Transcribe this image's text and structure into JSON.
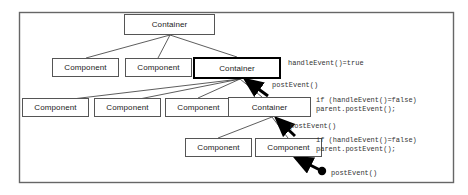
{
  "diagram": {
    "frame": {
      "border_color": "#666666"
    },
    "nodes": [
      {
        "id": "root",
        "label": "Container",
        "x": 124,
        "y": 14,
        "w": 91,
        "h": 21,
        "bold": false
      },
      {
        "id": "r2c1",
        "label": "Component",
        "x": 52,
        "y": 58,
        "w": 67,
        "h": 19,
        "bold": false
      },
      {
        "id": "r2c2",
        "label": "Component",
        "x": 125,
        "y": 58,
        "w": 67,
        "h": 19,
        "bold": false
      },
      {
        "id": "r2cont",
        "label": "Container",
        "x": 193,
        "y": 57,
        "w": 88,
        "h": 22,
        "bold": true
      },
      {
        "id": "r3c1",
        "label": "Component",
        "x": 22,
        "y": 98,
        "w": 67,
        "h": 19,
        "bold": false
      },
      {
        "id": "r3c2",
        "label": "Component",
        "x": 94,
        "y": 98,
        "w": 67,
        "h": 19,
        "bold": false
      },
      {
        "id": "r3c3",
        "label": "Component",
        "x": 165,
        "y": 98,
        "w": 67,
        "h": 19,
        "bold": false
      },
      {
        "id": "r3cont",
        "label": "Container",
        "x": 228,
        "y": 97,
        "w": 83,
        "h": 20,
        "bold": false
      },
      {
        "id": "r4c1",
        "label": "Component",
        "x": 185,
        "y": 138,
        "w": 67,
        "h": 19,
        "bold": false
      },
      {
        "id": "r4c2",
        "label": "Component",
        "x": 255,
        "y": 138,
        "w": 67,
        "h": 19,
        "bold": false
      }
    ],
    "annotations": [
      {
        "id": "handle-true",
        "text": "handleEvent()=true",
        "x": 288,
        "y": 59
      },
      {
        "id": "post-1",
        "text": "postEvent()",
        "x": 272,
        "y": 81
      },
      {
        "id": "if-block-1",
        "text": "if (handleEvent()=false)\nparent.postEvent();",
        "x": 316,
        "y": 96
      },
      {
        "id": "post-2",
        "text": "postEvent()",
        "x": 290,
        "y": 122
      },
      {
        "id": "if-block-2",
        "text": "if (handleEvent()=false)\nparent.postEvent();",
        "x": 316,
        "y": 136
      },
      {
        "id": "post-3",
        "text": "postEvent()",
        "x": 331,
        "y": 169
      }
    ]
  }
}
